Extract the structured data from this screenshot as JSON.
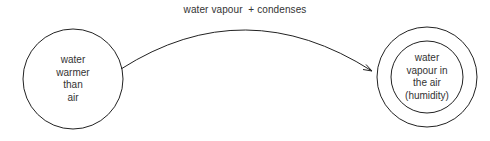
{
  "diagram": {
    "edge_label": {
      "part1": "water vapour",
      "part2": "+ condenses"
    },
    "nodes": [
      {
        "id": "source",
        "lines": [
          "water",
          "warmer",
          "than",
          "air"
        ],
        "shape": "circle"
      },
      {
        "id": "target",
        "lines": [
          "water",
          "vapour in",
          "the air",
          "(humidity)"
        ],
        "shape": "double-circle"
      }
    ],
    "edge": {
      "from": "source",
      "to": "target",
      "style": "curved-arrow"
    },
    "colors": {
      "stroke": "#222222",
      "text": "#333333",
      "background": "#ffffff"
    }
  }
}
